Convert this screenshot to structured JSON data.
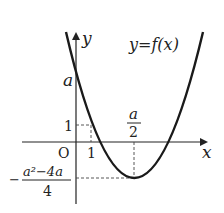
{
  "diagram": {
    "type": "function-graph",
    "curve_label": "y=f(x)",
    "axes": {
      "x_label": "x",
      "y_label": "y",
      "origin_label": "O"
    },
    "y_intercept_label": "a",
    "y_tick_label": "1",
    "x_tick_label": "1",
    "vertex_x_label": {
      "numerator": "a",
      "denominator": "2"
    },
    "vertex_y_label": {
      "sign": "−",
      "numerator": "a²−4a",
      "denominator": "4"
    },
    "colors": {
      "curve": "#1a1a1a",
      "axes": "#222222",
      "guides": "#444444"
    }
  }
}
